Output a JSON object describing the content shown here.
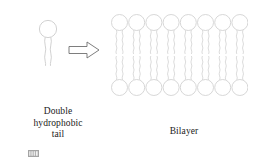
{
  "figure": {
    "title_present": false,
    "background_color": "#ffffff",
    "line_color": "#d2d2d2",
    "text_color": "#1a1a1a"
  },
  "single_lipid": {
    "name": "phospholipid-monomer",
    "head_shape": "circle",
    "head_diameter_px": 18,
    "tail_count": 2,
    "tail_length_px": 32
  },
  "arrow": {
    "name": "block-arrow-right",
    "direction": "right",
    "style": "hollow-outline"
  },
  "bilayer": {
    "name": "lipid-bilayer",
    "columns": 8,
    "leaflets": 2,
    "head_diameter_px": 16,
    "tails_per_lipid": 2,
    "tail_style": "wavy",
    "column_indices": [
      0,
      1,
      2,
      3,
      4,
      5,
      6,
      7
    ]
  },
  "labels": {
    "left_caption": "Double\nhydrophobic\ntail",
    "right_caption": "Bilayer"
  }
}
